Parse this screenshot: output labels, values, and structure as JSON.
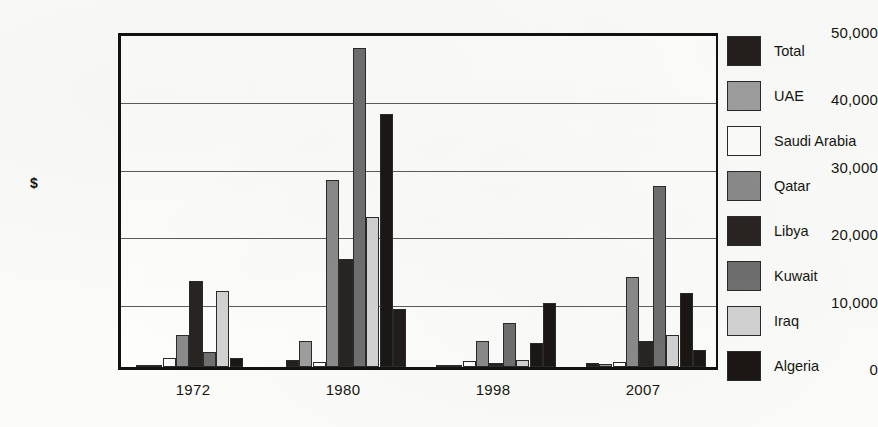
{
  "chart_data": {
    "type": "bar",
    "title": "",
    "xlabel": "",
    "ylabel": "$",
    "ylim": [
      0,
      50000
    ],
    "grid": true,
    "legend_position": "right",
    "categories": [
      "1972",
      "1980",
      "1998",
      "2007"
    ],
    "ytick_labels": [
      "50,000",
      "40,000",
      "30,000",
      "20,000",
      "10,000",
      "0"
    ],
    "ytick_values": [
      50000,
      40000,
      30000,
      20000,
      10000,
      0
    ],
    "series": [
      {
        "name": "Total",
        "color": "#231f1c",
        "values": [
          300,
          1000,
          200,
          600
        ]
      },
      {
        "name": "UAE",
        "color": "#9d9d9d",
        "values": [
          200,
          3900,
          300,
          500
        ]
      },
      {
        "name": "Saudi Arabia",
        "color": "#fdfdfb",
        "values": [
          1300,
          700,
          900,
          700
        ]
      },
      {
        "name": "Qatar",
        "color": "#8a8a8a",
        "values": [
          4800,
          27700,
          3900,
          13400
        ]
      },
      {
        "name": "Libya",
        "color": "#282422",
        "values": [
          12800,
          16000,
          600,
          3900
        ]
      },
      {
        "name": "Kuwait",
        "color": "#6f6f6f",
        "values": [
          2300,
          47400,
          6600,
          26800
        ]
      },
      {
        "name": "Iraq",
        "color": "#d2d2d2",
        "values": [
          11300,
          22300,
          1100,
          4800
        ]
      },
      {
        "name": "Algeria",
        "color": "#1a1714",
        "values": [
          1300,
          37500,
          3500,
          11000
        ]
      }
    ],
    "group_extra_bars": {
      "1980": {
        "note": "tall pale bar at 8,600 after Algeria",
        "value": 8600,
        "color": "#201d1a"
      },
      "1998": {
        "note": "dark bar at 9,500 after Algeria",
        "value": 9500,
        "color": "#1a1714"
      },
      "2007": {
        "note": "dark bar at 2,500 after Algeria",
        "value": 2500,
        "color": "#1a1714"
      }
    }
  },
  "legend": {
    "items": [
      {
        "label": "Total",
        "color": "#231f1c"
      },
      {
        "label": "UAE",
        "color": "#9d9d9d"
      },
      {
        "label": "Saudi Arabia",
        "color": "#fdfdfb"
      },
      {
        "label": "Qatar",
        "color": "#8a8a8a"
      },
      {
        "label": "Libya",
        "color": "#282422"
      },
      {
        "label": "Kuwait",
        "color": "#6f6f6f"
      },
      {
        "label": "Iraq",
        "color": "#d2d2d2"
      },
      {
        "label": "Algeria",
        "color": "#1a1714"
      }
    ]
  },
  "axis": {
    "y_title": "$"
  }
}
